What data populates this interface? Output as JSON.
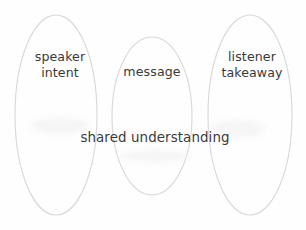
{
  "diagram": {
    "type": "venn-three-ellipse",
    "background_color": "#fefefe",
    "stroke_color": "#d9d9d9",
    "text_color": "#3a3a3a",
    "regions": [
      {
        "name": "speaker-intent",
        "label": "speaker\nintent",
        "position": "left"
      },
      {
        "name": "message",
        "label": "message",
        "position": "center"
      },
      {
        "name": "listener-takeaway",
        "label": "listener\ntakeaway",
        "position": "right"
      },
      {
        "name": "shared-understanding",
        "label": "shared understanding",
        "position": "overlap-center"
      }
    ]
  }
}
